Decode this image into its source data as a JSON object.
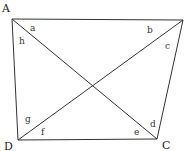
{
  "diagram": {
    "type": "quadrilateral-with-diagonals",
    "stroke_color": "#333333",
    "vertices": [
      {
        "id": "A",
        "label": "A",
        "x": 12,
        "y": 19,
        "label_x": 2,
        "label_y": 12
      },
      {
        "id": "B",
        "label": "",
        "x": 183,
        "y": 20,
        "label_x": 183,
        "label_y": 20
      },
      {
        "id": "C",
        "label": "C",
        "x": 157,
        "y": 139,
        "label_x": 162,
        "label_y": 149
      },
      {
        "id": "D",
        "label": "D",
        "x": 18,
        "y": 140,
        "label_x": 4,
        "label_y": 150
      }
    ],
    "edges": [
      {
        "from": "A",
        "to": "B"
      },
      {
        "from": "B",
        "to": "C"
      },
      {
        "from": "C",
        "to": "D"
      },
      {
        "from": "D",
        "to": "A"
      },
      {
        "from": "A",
        "to": "C"
      },
      {
        "from": "B",
        "to": "D"
      }
    ],
    "angle_labels": [
      {
        "text": "a",
        "x": 30,
        "y": 31
      },
      {
        "text": "b",
        "x": 147,
        "y": 33
      },
      {
        "text": "c",
        "x": 165,
        "y": 49
      },
      {
        "text": "d",
        "x": 150,
        "y": 127
      },
      {
        "text": "e",
        "x": 134,
        "y": 135
      },
      {
        "text": "f",
        "x": 41,
        "y": 135
      },
      {
        "text": "g",
        "x": 25,
        "y": 122
      },
      {
        "text": "h",
        "x": 19,
        "y": 44
      }
    ]
  }
}
